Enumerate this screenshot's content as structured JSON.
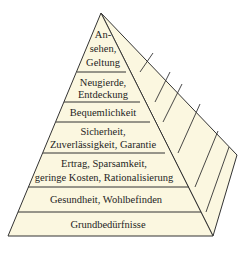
{
  "diagram": {
    "type": "pyramid",
    "fill_color": "#fbf7e0",
    "stroke_color": "#333333",
    "levels": [
      {
        "lines": [
          "An-",
          "sehen,",
          "Geltung"
        ]
      },
      {
        "lines": [
          "Neugierde,",
          "Entdeckung"
        ]
      },
      {
        "lines": [
          "Bequemlichkeit"
        ]
      },
      {
        "lines": [
          "Sicherheit,",
          "Zuverlässigkeit, Garantie"
        ]
      },
      {
        "lines": [
          "Ertrag, Sparsamkeit,",
          "geringe Kosten, Rationalisierung"
        ]
      },
      {
        "lines": [
          "Gesundheit, Wohlbefinden"
        ]
      },
      {
        "lines": [
          "Grundbedürfnisse"
        ]
      }
    ]
  }
}
